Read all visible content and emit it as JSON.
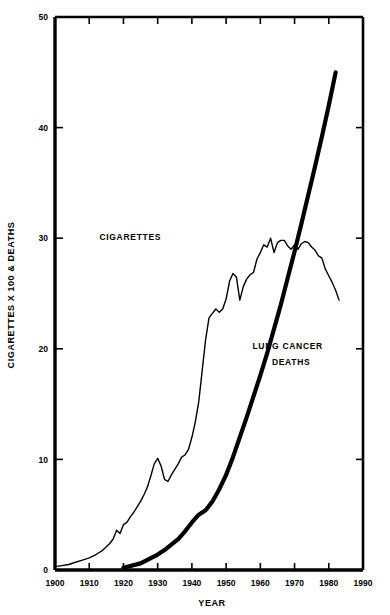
{
  "chart_data": {
    "type": "line",
    "title": "",
    "xlabel": "YEAR",
    "ylabel": "CIGARETTES X 100 & DEATHS",
    "xlim": [
      1900,
      1990
    ],
    "ylim": [
      0,
      50
    ],
    "xticks": [
      1900,
      1910,
      1920,
      1930,
      1940,
      1950,
      1960,
      1970,
      1980,
      1990
    ],
    "xtick_labels": [
      "1900",
      "1910",
      "1920",
      "1930",
      "1940",
      "1950",
      "1960",
      "1970",
      "1980",
      "1990"
    ],
    "yticks": [
      0,
      10,
      20,
      30,
      40,
      50
    ],
    "ytick_labels": [
      "0",
      "10",
      "20",
      "30",
      "40",
      "50"
    ],
    "grid": false,
    "legend": "inline-annotations",
    "frame": "all-four-sides-with-inward-ticks",
    "annotations": [
      {
        "text": "CIGARETTES",
        "x": 1922,
        "y": 29.8
      },
      {
        "text": "LUNG CANCER",
        "x": 1968,
        "y": 20.0
      },
      {
        "text": "DEATHS",
        "x": 1969,
        "y": 18.5
      }
    ],
    "series": [
      {
        "name": "CIGARETTES",
        "line_width": 1.4,
        "color": "#000000",
        "x": [
          1900,
          1902,
          1904,
          1906,
          1908,
          1910,
          1912,
          1914,
          1916,
          1917,
          1918,
          1919,
          1920,
          1921,
          1922,
          1923,
          1924,
          1925,
          1926,
          1927,
          1928,
          1929,
          1930,
          1931,
          1932,
          1933,
          1934,
          1935,
          1936,
          1937,
          1938,
          1939,
          1940,
          1941,
          1942,
          1943,
          1944,
          1945,
          1946,
          1947,
          1948,
          1949,
          1950,
          1951,
          1952,
          1953,
          1954,
          1955,
          1956,
          1957,
          1958,
          1959,
          1960,
          1961,
          1962,
          1963,
          1964,
          1965,
          1966,
          1967,
          1968,
          1969,
          1970,
          1971,
          1972,
          1973,
          1974,
          1975,
          1976,
          1977,
          1978,
          1979,
          1980,
          1981,
          1982,
          1983
        ],
        "y": [
          0.3,
          0.4,
          0.5,
          0.7,
          0.9,
          1.1,
          1.4,
          1.8,
          2.4,
          2.8,
          3.6,
          3.3,
          4.1,
          4.3,
          4.8,
          5.2,
          5.7,
          6.2,
          6.8,
          7.5,
          8.5,
          9.6,
          10.1,
          9.4,
          8.2,
          8.0,
          8.6,
          9.1,
          9.6,
          10.2,
          10.4,
          10.9,
          12.0,
          13.4,
          15.2,
          18.0,
          20.8,
          22.8,
          23.2,
          23.6,
          23.3,
          23.6,
          24.5,
          26.1,
          26.8,
          26.5,
          24.4,
          25.6,
          26.3,
          26.7,
          26.9,
          28.1,
          28.7,
          29.4,
          29.2,
          30.0,
          28.7,
          29.6,
          29.8,
          29.8,
          29.3,
          29.0,
          29.4,
          29.0,
          29.5,
          29.7,
          29.6,
          29.2,
          28.9,
          28.4,
          28.2,
          27.2,
          26.6,
          26.0,
          25.3,
          24.4
        ]
      },
      {
        "name": "LUNG CANCER DEATHS",
        "line_width": 4.2,
        "color": "#000000",
        "x": [
          1920,
          1925,
          1930,
          1932,
          1934,
          1936,
          1938,
          1940,
          1942,
          1944,
          1946,
          1948,
          1950,
          1952,
          1954,
          1956,
          1958,
          1960,
          1962,
          1964,
          1966,
          1968,
          1970,
          1972,
          1974,
          1976,
          1978,
          1980,
          1982
        ],
        "y": [
          0.2,
          0.6,
          1.4,
          1.8,
          2.3,
          2.8,
          3.5,
          4.3,
          5.0,
          5.4,
          6.2,
          7.3,
          8.6,
          10.2,
          12.0,
          13.8,
          15.7,
          17.6,
          19.6,
          21.8,
          24.0,
          26.4,
          28.8,
          31.3,
          33.9,
          36.5,
          39.2,
          42.0,
          45.0
        ]
      }
    ],
    "note_scale": "Cigarettes values plotted as consumption x100; deaths plotted on same axis"
  }
}
